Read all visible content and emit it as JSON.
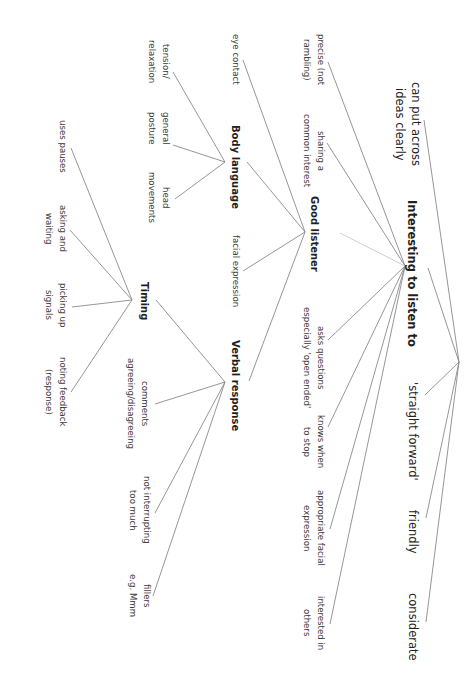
{
  "diagram": {
    "type": "mind-map",
    "orientation": "rotated 90deg clockwise (text reads top-to-bottom)",
    "line_color": "#8a8a8a",
    "text_color": "#2b2b2b",
    "background": "#ffffff",
    "root": {
      "label": "Interesting to listen to",
      "children_direct": [
        "can put across ideas clearly",
        "'straight forward'",
        "friendly",
        "considerate"
      ]
    },
    "hubs": {
      "interesting": "Interesting to listen to",
      "good_listener": "Good listener",
      "body_language": "Body language",
      "verbal_response": "Verbal response",
      "timing": "Timing"
    },
    "outer": {
      "can_put_across_1": "can put across",
      "can_put_across_2": "ideas clearly",
      "straight_forward": "'straight forward'",
      "friendly": "friendly",
      "considerate": "considerate"
    },
    "interesting_children": {
      "precise_1": "precise (not",
      "precise_2": "rambling)",
      "sharing_1": "sharing a",
      "sharing_2": "common interest",
      "asks_1": "asks questions",
      "asks_2": "especially 'open ended'",
      "knows_1": "knows when",
      "knows_2": "to stop",
      "appropriate_1": "appropriate facial",
      "appropriate_2": "expression",
      "interested_1": "interested in",
      "interested_2": "others"
    },
    "good_listener_children": {
      "eye_contact": "eye contact",
      "facial_expression": "facial expression"
    },
    "body_language_children": {
      "tension_1": "tension/",
      "tension_2": "relaxation",
      "posture_1": "general",
      "posture_2": "posture",
      "head_1": "head",
      "head_2": "movements"
    },
    "verbal_children": {
      "comments_1": "comments",
      "comments_2": "agreeing/disagreeing",
      "not_interrupting_1": "not interrupting",
      "not_interrupting_2": "too much",
      "fillers_1": "fillers",
      "fillers_2": "e.g. Mmm"
    },
    "timing_children": {
      "pauses": "uses pauses",
      "asking_1": "asking and",
      "asking_2": "waiting",
      "picking_1": "picking up",
      "picking_2": "signals",
      "noting_1": "noting feedback",
      "noting_2": "(response)"
    }
  }
}
